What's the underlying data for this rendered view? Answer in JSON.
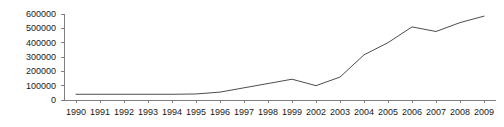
{
  "chart_data": {
    "type": "line",
    "title": "",
    "subtitle": "",
    "xlabel": "",
    "ylabel": "",
    "categories": [
      "1990",
      "1991",
      "1992",
      "1993",
      "1994",
      "1995",
      "1996",
      "1997",
      "1998",
      "1999",
      "2002",
      "2003",
      "2004",
      "2005",
      "2006",
      "2007",
      "2008",
      "2009"
    ],
    "values": [
      40000,
      40000,
      40000,
      40000,
      40000,
      42000,
      55000,
      85000,
      115000,
      145000,
      100000,
      160000,
      315000,
      400000,
      510000,
      478000,
      540000,
      585000
    ],
    "series": [
      {
        "name": "",
        "values": [
          40000,
          40000,
          40000,
          40000,
          40000,
          42000,
          55000,
          85000,
          115000,
          145000,
          100000,
          160000,
          315000,
          400000,
          510000,
          478000,
          540000,
          585000
        ]
      }
    ],
    "ylim": [
      0,
      600000
    ],
    "yticks": [
      0,
      100000,
      200000,
      300000,
      400000,
      500000,
      600000
    ],
    "ytick_labels": [
      "0",
      "100000",
      "200000",
      "300000",
      "400000",
      "500000",
      "600000"
    ],
    "grid": false,
    "legend": null,
    "legend_position": "none",
    "line_color": "#4d4d4d",
    "axis_color": "#808080",
    "text_color": "#1a1a1a",
    "background": "#ffffff"
  }
}
